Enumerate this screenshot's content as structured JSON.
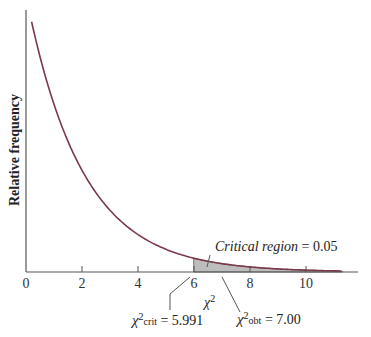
{
  "chart_data": {
    "type": "area",
    "title": "",
    "xlabel": "χ²",
    "ylabel": "Relative frequency",
    "distribution": "chi-square, df = 2",
    "xlim": [
      0,
      11.4
    ],
    "x_ticks": [
      "0",
      "2",
      "4",
      "6",
      "8",
      "10"
    ],
    "x": [
      0.2,
      1,
      2,
      3,
      4,
      5,
      6,
      7,
      8,
      9,
      10,
      11.3
    ],
    "values": [
      0.452,
      0.303,
      0.184,
      0.112,
      0.068,
      0.041,
      0.025,
      0.015,
      0.009,
      0.006,
      0.003,
      0.002
    ],
    "shaded_region": {
      "from": 5.991,
      "to": 11.3,
      "area": 0.05
    },
    "annotations": {
      "critical_region": "Critical region = 0.05",
      "crit_label": "χ²",
      "crit_sub": "crit",
      "crit_value": "= 5.991",
      "obt_label": "χ²",
      "obt_sub": "obt",
      "obt_value": "= 7.00"
    },
    "grid": false
  }
}
